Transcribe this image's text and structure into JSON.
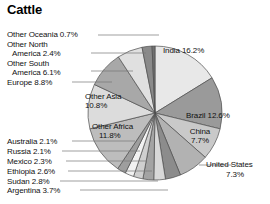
{
  "title": "Cattle",
  "chart_data": {
    "type": "pie",
    "title": "Cattle",
    "xlabel": "",
    "ylabel": "",
    "legend_position": "none",
    "grid": false,
    "unit": "%",
    "categories": [
      "India",
      "Brazil",
      "China",
      "United States",
      "Argentina",
      "Sudan",
      "Ethiopia",
      "Mexico",
      "Russia",
      "Australia",
      "Other Africa",
      "Other Asia",
      "Europe",
      "Other South America",
      "Other North America",
      "Other Oceania"
    ],
    "values": [
      16.2,
      12.6,
      7.7,
      7.3,
      3.7,
      2.8,
      2.6,
      2.3,
      2.1,
      2.1,
      11.8,
      10.8,
      8.8,
      6.1,
      2.4,
      0.7
    ],
    "slices": [
      {
        "label": "India",
        "value": 16.2,
        "text": "India 16.2%",
        "color": "#e8e8e8"
      },
      {
        "label": "Brazil",
        "value": 12.6,
        "text": "Brazil 12.6%",
        "color": "#9a9a9a"
      },
      {
        "label": "China",
        "value": 7.7,
        "text": "China\n7.7%",
        "color": "#c9c9c9"
      },
      {
        "label": "United States",
        "value": 7.3,
        "text": "United States 7.3%",
        "color": "#b2b2b2"
      },
      {
        "label": "Argentina",
        "value": 3.7,
        "text": "Argentina 3.7%",
        "color": "#8c8c8c"
      },
      {
        "label": "Sudan",
        "value": 2.8,
        "text": "Sudan 2.8%",
        "color": "#d8d8d8"
      },
      {
        "label": "Ethiopia",
        "value": 2.6,
        "text": "Ethiopia 2.6%",
        "color": "#a3a3a3"
      },
      {
        "label": "Mexico",
        "value": 2.3,
        "text": "Mexico 2.3%",
        "color": "#cfcfcf"
      },
      {
        "label": "Russia",
        "value": 2.1,
        "text": "Russia 2.1%",
        "color": "#f2f2f2"
      },
      {
        "label": "Australia",
        "value": 2.1,
        "text": "Australia 2.1%",
        "color": "#9e9e9e"
      },
      {
        "label": "Other Africa",
        "value": 11.8,
        "text": "Other Africa 11.8%",
        "color": "#bdbdbd"
      },
      {
        "label": "Other Asia",
        "value": 10.8,
        "text": "Other Asia 10.8%",
        "color": "#dcdcdc"
      },
      {
        "label": "Europe",
        "value": 8.8,
        "text": "Europe 8.8%",
        "color": "#a8a8a8"
      },
      {
        "label": "Other South America",
        "value": 6.1,
        "text": "Other South America 6.1%",
        "color": "#e0e0e0"
      },
      {
        "label": "Other North America",
        "value": 2.4,
        "text": "Other North America 2.4%",
        "color": "#8a8a8a"
      },
      {
        "label": "Other Oceania",
        "value": 0.7,
        "text": "Other Oceania 0.7%",
        "color": "#707070"
      }
    ]
  },
  "labels": {
    "inside": {
      "india": "India 16.2%",
      "brazil": "Brazil 12.6%",
      "china_name": "China",
      "china_value": "7.7%",
      "other_asia_name": "Other Asia",
      "other_asia_value": "10.8%",
      "other_africa_name": "Other Africa",
      "other_africa_value": "11.8%"
    },
    "outside": {
      "united_states_name": "United States",
      "united_states_value": "7.3%",
      "other_oceania": "Other Oceania 0.7%",
      "other_north_l1": "Other North",
      "other_north_l2": "America 2.4%",
      "other_south_l1": "Other South",
      "other_south_l2": "America 6.1%",
      "europe": "Europe 8.8%",
      "australia": "Australia 2.1%",
      "russia": "Russia 2.1%",
      "mexico": "Mexico 2.3%",
      "ethiopia": "Ethiopia 2.6%",
      "sudan": "Sudan 2.8%",
      "argentina": "Argentina 3.7%"
    }
  },
  "colors": {
    "background": "#ffffff",
    "stroke": "#4d4d4d",
    "text": "#111111",
    "leader": "#777777"
  }
}
